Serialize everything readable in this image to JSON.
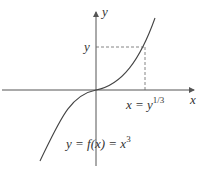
{
  "diagram": {
    "axes": {
      "x_label": "x",
      "y_label": "y"
    },
    "point_labels": {
      "y_tick": "y",
      "x_tick_base": "x = y",
      "x_tick_exp": "1/3"
    },
    "curve_label": {
      "base": "y = f(x) = x",
      "exp": "3"
    },
    "colors": {
      "axis": "#555555",
      "curve": "#444444",
      "dashed": "#666666"
    }
  }
}
